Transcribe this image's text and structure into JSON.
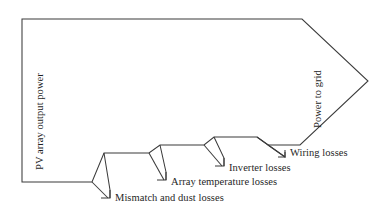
{
  "diagram": {
    "type": "sankey-style-arrow-flow",
    "stroke_color": "#3b3b3b",
    "background_color": "#ffffff",
    "input_label": "PV array output power",
    "output_label": "Power to grid",
    "losses": [
      {
        "id": "mismatch",
        "label": "Mismatch and dust losses"
      },
      {
        "id": "array-temperature",
        "label": "Array temperature losses"
      },
      {
        "id": "inverter",
        "label": "Inverter losses"
      },
      {
        "id": "wiring",
        "label": "Wiring losses"
      }
    ],
    "geometry": {
      "band_left_x": 22,
      "band_top_y": 19,
      "band_bottom_y": 182,
      "arrow_tip_x": 368,
      "arrow_tip_y": 81,
      "arrow_base_x": 302
    }
  }
}
